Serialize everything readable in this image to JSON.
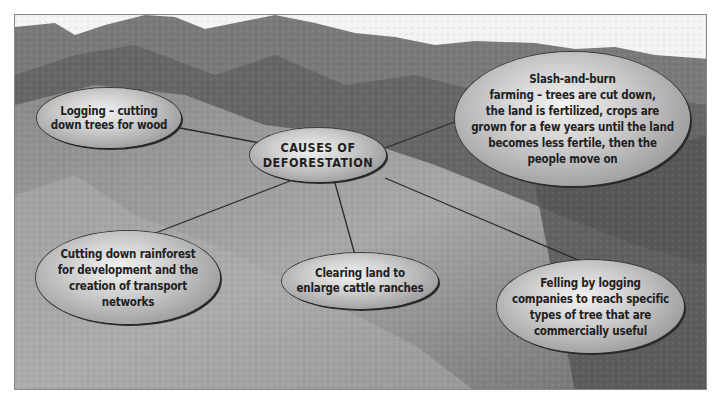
{
  "diagram": {
    "title": "CAUSES OF DEFORESTATION",
    "center": {
      "label": "CAUSES OF\nDEFORESTATION"
    },
    "causes": [
      {
        "id": "logging",
        "label": "Logging – cutting\ndown trees for wood"
      },
      {
        "id": "slash-and-burn",
        "label": "Slash-and-burn\nfarming – trees are cut down,\nthe land is fertilized, crops are\ngrown for a few years until the land\nbecomes less fertile, then the\npeople move on"
      },
      {
        "id": "development",
        "label": "Cutting down rainforest\nfor development and the\ncreation of transport\nnetworks"
      },
      {
        "id": "cattle-ranches",
        "label": "Clearing land to\nenlarge cattle ranches"
      },
      {
        "id": "felling",
        "label": "Felling by logging\ncompanies to reach specific\ntypes of tree that are\ncommercially useful"
      }
    ],
    "background": "aerial photograph of deforested mountain slopes",
    "colors": {
      "bubble_light": "#f2f2f2",
      "bubble_dark": "#7c7c7c",
      "text": "#1f1f1f",
      "connector": "#2a2a2a"
    }
  }
}
